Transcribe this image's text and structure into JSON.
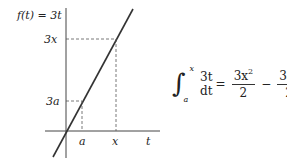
{
  "function_label": "f(t) = 3t",
  "axes": {
    "x_axis_label": "t",
    "x_ticks": [
      "a",
      "x"
    ],
    "y_ticks": [
      "3a",
      "3x"
    ]
  },
  "formula": {
    "integral_sign": "∫",
    "upper_limit": "x",
    "lower_limit": "a",
    "integrand": "3t dt",
    "equals": "=",
    "term1_numerator": "3x",
    "term1_exponent": "2",
    "term1_denominator": "2",
    "minus": "−",
    "term2_numerator": "3a",
    "term2_exponent": "2",
    "term2_denominator": "2"
  },
  "colors": {
    "line": "#333333",
    "axes": "#444444",
    "dashed": "#555555"
  }
}
